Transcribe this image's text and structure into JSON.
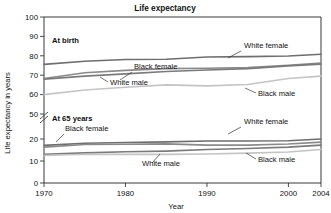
{
  "chart_data": {
    "type": "line",
    "title": "Life expectancy",
    "xlabel": "Year",
    "ylabel": "Life expectancy in years",
    "xlim": [
      1970,
      2004
    ],
    "ylim": [
      0,
      100
    ],
    "grid": false,
    "legend_position": "inline-annotations",
    "y_axis_break": {
      "present": true,
      "between": [
        20,
        50
      ],
      "symbol": "broken-axis-slash"
    },
    "xticks": [
      1970,
      1980,
      1990,
      2000,
      2004
    ],
    "xtick_labels": [
      "1970",
      "1980",
      "1990",
      "2000",
      "2004"
    ],
    "yticks": [
      0,
      10,
      20,
      50,
      60,
      70,
      80,
      90,
      100
    ],
    "ytick_labels": [
      "0",
      "10",
      "20",
      "50",
      "60",
      "70",
      "80",
      "90",
      "100"
    ],
    "groups": [
      {
        "name": "At birth",
        "label": "At birth",
        "series": [
          {
            "name": "White female",
            "color": "#6e6e6e",
            "x": [
              1970,
              1975,
              1980,
              1985,
              1990,
              1995,
              2000,
              2004
            ],
            "values": [
              75.6,
              77.2,
              78.1,
              78.2,
              79.4,
              79.6,
              79.9,
              80.8
            ]
          },
          {
            "name": "Black female",
            "color": "#8a8a8a",
            "x": [
              1970,
              1975,
              1980,
              1985,
              1990,
              1995,
              2000,
              2004
            ],
            "values": [
              68.3,
              71.3,
              72.5,
              73.4,
              73.6,
              73.9,
              75.1,
              76.3
            ]
          },
          {
            "name": "White male",
            "color": "#7a7a7a",
            "x": [
              1970,
              1975,
              1980,
              1985,
              1990,
              1995,
              2000,
              2004
            ],
            "values": [
              68.0,
              69.5,
              70.7,
              71.9,
              72.7,
              73.4,
              74.8,
              75.7
            ]
          },
          {
            "name": "Black male",
            "color": "#c4c4c4",
            "x": [
              1970,
              1975,
              1980,
              1985,
              1990,
              1995,
              2000,
              2004
            ],
            "values": [
              60.0,
              62.4,
              63.8,
              65.0,
              64.5,
              65.2,
              68.3,
              69.5
            ]
          }
        ]
      },
      {
        "name": "At 65 years",
        "label": "At 65 years",
        "series": [
          {
            "name": "White female",
            "color": "#6e6e6e",
            "x": [
              1970,
              1975,
              1980,
              1985,
              1990,
              1995,
              2000,
              2004
            ],
            "values": [
              17.1,
              18.1,
              18.4,
              18.7,
              19.1,
              19.1,
              19.2,
              20.0
            ]
          },
          {
            "name": "Black female",
            "color": "#8a8a8a",
            "x": [
              1970,
              1975,
              1980,
              1985,
              1990,
              1995,
              2000,
              2004
            ],
            "values": [
              16.3,
              17.5,
              17.6,
              17.8,
              17.2,
              17.2,
              17.7,
              18.6
            ]
          },
          {
            "name": "White male",
            "color": "#7a7a7a",
            "x": [
              1970,
              1975,
              1980,
              1985,
              1990,
              1995,
              2000,
              2004
            ],
            "values": [
              13.1,
              13.7,
              14.2,
              14.5,
              15.2,
              15.7,
              16.3,
              17.2
            ]
          },
          {
            "name": "Black male",
            "color": "#c4c4c4",
            "x": [
              1970,
              1975,
              1980,
              1985,
              1990,
              1995,
              2000,
              2004
            ],
            "values": [
              12.5,
              13.1,
              13.0,
              13.0,
              13.2,
              13.6,
              14.1,
              15.2
            ]
          }
        ]
      }
    ],
    "annotations": [
      {
        "text": "White female",
        "group": "At birth",
        "tx": 244,
        "ty": 48,
        "lx1": 241,
        "ly1": 51,
        "lx2": 228,
        "ly2": 58
      },
      {
        "text": "Black female",
        "group": "At birth",
        "tx": 134,
        "ty": 69,
        "lx1": 132,
        "ly1": 72,
        "lx2": 120,
        "ly2": 80
      },
      {
        "text": "White male",
        "group": "At birth",
        "tx": 110,
        "ty": 85,
        "lx1": 108,
        "ly1": 82,
        "lx2": 100,
        "ly2": 77
      },
      {
        "text": "Black male",
        "group": "At birth",
        "tx": 258,
        "ty": 96,
        "lx1": 256,
        "ly1": 93,
        "lx2": 245,
        "ly2": 88
      },
      {
        "text": "White female",
        "group": "At 65 years",
        "tx": 244,
        "ty": 124,
        "lx1": 241,
        "ly1": 127,
        "lx2": 228,
        "ly2": 134
      },
      {
        "text": "Black female",
        "group": "At 65 years",
        "tx": 65,
        "ty": 131,
        "lx1": 64,
        "ly1": 134,
        "lx2": 56,
        "ly2": 142
      },
      {
        "text": "White male",
        "group": "At 65 years",
        "tx": 142,
        "ty": 166,
        "lx1": 152,
        "ly1": 163,
        "lx2": 160,
        "ly2": 154
      },
      {
        "text": "Black male",
        "group": "At 65 years",
        "tx": 258,
        "ty": 162,
        "lx1": 256,
        "ly1": 159,
        "lx2": 246,
        "ly2": 153
      }
    ]
  },
  "colors": {
    "white_female": "#6e6e6e",
    "black_female": "#8a8a8a",
    "white_male": "#7a7a7a",
    "black_male": "#c4c4c4",
    "axis": "#222222",
    "background": "#ffffff"
  }
}
